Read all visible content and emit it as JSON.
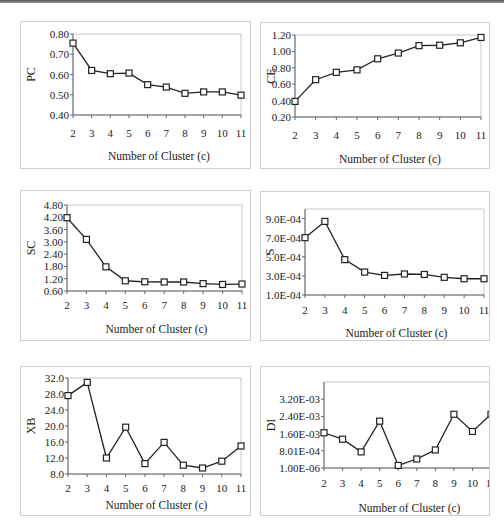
{
  "chart_data": [
    {
      "id": "pc",
      "type": "line",
      "title": "",
      "xlabel": "Number of Cluster (c)",
      "ylabel": "PC",
      "categories": [
        "2",
        "3",
        "4",
        "5",
        "6",
        "7",
        "8",
        "9",
        "10",
        "11"
      ],
      "values": [
        0.755,
        0.62,
        0.604,
        0.607,
        0.55,
        0.538,
        0.507,
        0.514,
        0.514,
        0.498
      ],
      "ylim": [
        0.4,
        0.8
      ],
      "yticks": [
        0.4,
        0.5,
        0.6,
        0.7,
        0.8
      ],
      "ytick_labels": [
        "0.40",
        "0.50",
        "0.60",
        "0.70",
        "0.80"
      ],
      "marker": "square",
      "grid": false
    },
    {
      "id": "ce",
      "type": "line",
      "title": "",
      "xlabel": "Number of Cluster (c)",
      "ylabel": "CE",
      "categories": [
        "2",
        "3",
        "4",
        "5",
        "6",
        "7",
        "8",
        "9",
        "10",
        "11"
      ],
      "values": [
        0.39,
        0.655,
        0.745,
        0.775,
        0.91,
        0.98,
        1.07,
        1.075,
        1.105,
        1.17
      ],
      "ylim": [
        0.2,
        1.2
      ],
      "yticks": [
        0.2,
        0.4,
        0.6,
        0.8,
        1.0,
        1.2
      ],
      "ytick_labels": [
        "0.20",
        "0.40",
        "0.60",
        "0.80",
        "1.00",
        "1.20"
      ],
      "marker": "square",
      "grid": false
    },
    {
      "id": "sc",
      "type": "line",
      "title": "",
      "xlabel": "Number of Cluster (c)",
      "ylabel": "SC",
      "categories": [
        "2",
        "3",
        "4",
        "5",
        "6",
        "7",
        "8",
        "9",
        "10",
        "11"
      ],
      "values": [
        4.18,
        3.12,
        1.78,
        1.1,
        1.05,
        1.04,
        1.04,
        0.96,
        0.92,
        0.94
      ],
      "ylim": [
        0.6,
        4.8
      ],
      "yticks": [
        0.6,
        1.2,
        1.8,
        2.4,
        3.0,
        3.6,
        4.2,
        4.8
      ],
      "ytick_labels": [
        "0.60",
        "1.20",
        "1.80",
        "2.40",
        "3.00",
        "3.60",
        "4.20",
        "4.80"
      ],
      "marker": "square",
      "grid": false
    },
    {
      "id": "s",
      "type": "line",
      "title": "",
      "xlabel": "Number of Cluster (c)",
      "ylabel": "S",
      "categories": [
        "2",
        "3",
        "4",
        "5",
        "6",
        "7",
        "8",
        "9",
        "10",
        "11"
      ],
      "values": [
        0.0007,
        0.00087,
        0.00047,
        0.00034,
        0.000305,
        0.00032,
        0.000315,
        0.000285,
        0.00027,
        0.00027
      ],
      "ylim": [
        0.0001,
        0.001
      ],
      "yticks": [
        0.0001,
        0.0003,
        0.0005,
        0.0007,
        0.0009
      ],
      "ytick_labels": [
        "1.0E-04",
        "3.0E-04",
        "5.0E-04",
        "7.0E-04",
        "9.0E-04"
      ],
      "marker": "square",
      "grid": false
    },
    {
      "id": "xb",
      "type": "line",
      "title": "",
      "xlabel": "Number of Cluster (c)",
      "ylabel": "XB",
      "categories": [
        "2",
        "3",
        "4",
        "5",
        "6",
        "7",
        "8",
        "9",
        "10",
        "11"
      ],
      "values": [
        27.6,
        30.9,
        12.0,
        19.7,
        10.6,
        15.9,
        10.2,
        9.5,
        11.2,
        15.0
      ],
      "ylim": [
        8.0,
        32.0
      ],
      "yticks": [
        8.0,
        12.0,
        16.0,
        20.0,
        24.0,
        28.0,
        32.0
      ],
      "ytick_labels": [
        "8.0",
        "12.0",
        "16.0",
        "20.0",
        "24.0",
        "28.0",
        "32.0"
      ],
      "marker": "square",
      "grid": false
    },
    {
      "id": "di",
      "type": "line",
      "title": "",
      "xlabel": "Number of Cluster (c)",
      "ylabel": "DI",
      "categories": [
        "2",
        "3",
        "4",
        "5",
        "6",
        "7",
        "8",
        "9",
        "10",
        "11"
      ],
      "values": [
        0.00164,
        0.00134,
        0.00075,
        0.00218,
        0.00012,
        0.00042,
        0.00084,
        0.0025,
        0.0017,
        0.0025
      ],
      "ylim": [
        1e-06,
        0.004
      ],
      "yticks": [
        1e-06,
        0.000801,
        0.0016,
        0.0024,
        0.0032
      ],
      "ytick_labels": [
        "1.00E-06",
        "8.01E-04",
        "1.60E-03",
        "2.40E-03",
        "3.20E-03"
      ],
      "marker": "square",
      "grid": false
    }
  ]
}
